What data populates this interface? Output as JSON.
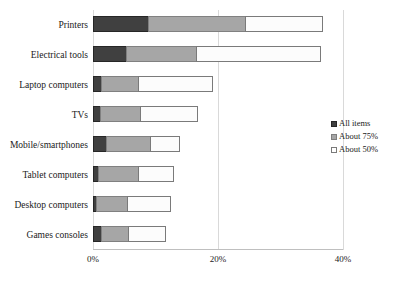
{
  "chart_data": {
    "type": "bar",
    "orientation": "horizontal",
    "stacked": true,
    "title": "",
    "xlabel": "",
    "ylabel": "",
    "xlim": [
      0,
      40
    ],
    "xticks": [
      "0%",
      "20%",
      "40%"
    ],
    "xtick_values": [
      0,
      20,
      40
    ],
    "grid": true,
    "legend_position": "right",
    "categories": [
      "Printers",
      "Electrical tools",
      "Laptop computers",
      "TVs",
      "Mobile/smartphones",
      "Tablet computers",
      "Desktop computers",
      "Games consoles"
    ],
    "series": [
      {
        "name": "All items",
        "color": "#404040",
        "values": [
          8.8,
          5.3,
          1.3,
          1.1,
          2.1,
          0.8,
          0.5,
          1.3
        ]
      },
      {
        "name": "About 75%",
        "color": "#a6a6a6",
        "values": [
          15.5,
          11.2,
          5.9,
          6.4,
          7.0,
          6.4,
          5.0,
          4.3
        ]
      },
      {
        "name": "About 50%",
        "color": "#ffffff",
        "values": [
          12.5,
          20.0,
          12.0,
          9.3,
          4.8,
          5.8,
          6.9,
          6.1
        ]
      }
    ],
    "totals": [
      36.8,
      36.5,
      19.2,
      16.8,
      13.9,
      13.0,
      12.4,
      11.7
    ]
  },
  "legend": {
    "items": [
      {
        "label": "All items"
      },
      {
        "label": "About 75%"
      },
      {
        "label": "About 50%"
      }
    ]
  }
}
